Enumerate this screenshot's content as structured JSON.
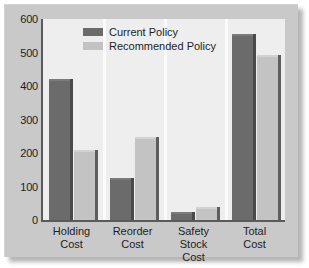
{
  "chart_data": {
    "type": "bar",
    "title": "",
    "xlabel": "",
    "ylabel": "",
    "ylim": [
      0,
      600
    ],
    "yticks": [
      0,
      100,
      200,
      300,
      400,
      500,
      600
    ],
    "grid": false,
    "legend_position": "top-center",
    "categories": [
      "Holding Cost",
      "Reorder Cost",
      "Safety Stock Cost",
      "Total Cost"
    ],
    "category_lines": [
      [
        "Holding",
        "Cost"
      ],
      [
        "Reorder",
        "Cost"
      ],
      [
        "Safety Stock",
        "Cost"
      ],
      [
        "Total",
        "Cost"
      ]
    ],
    "series": [
      {
        "name": "Current Policy",
        "color": "#6b6b6b",
        "values": [
          420,
          125,
          25,
          556
        ]
      },
      {
        "name": "Recommended Policy",
        "color": "#c3c3c3",
        "values": [
          210,
          248,
          38,
          492
        ]
      }
    ]
  },
  "style": {
    "panel_color": "#c9c9c9",
    "plot_background": "#eeeeee",
    "axis_color": "#5a5a5a",
    "separator_color": "#fbfbfb",
    "text_color": "#1d1d1d"
  }
}
